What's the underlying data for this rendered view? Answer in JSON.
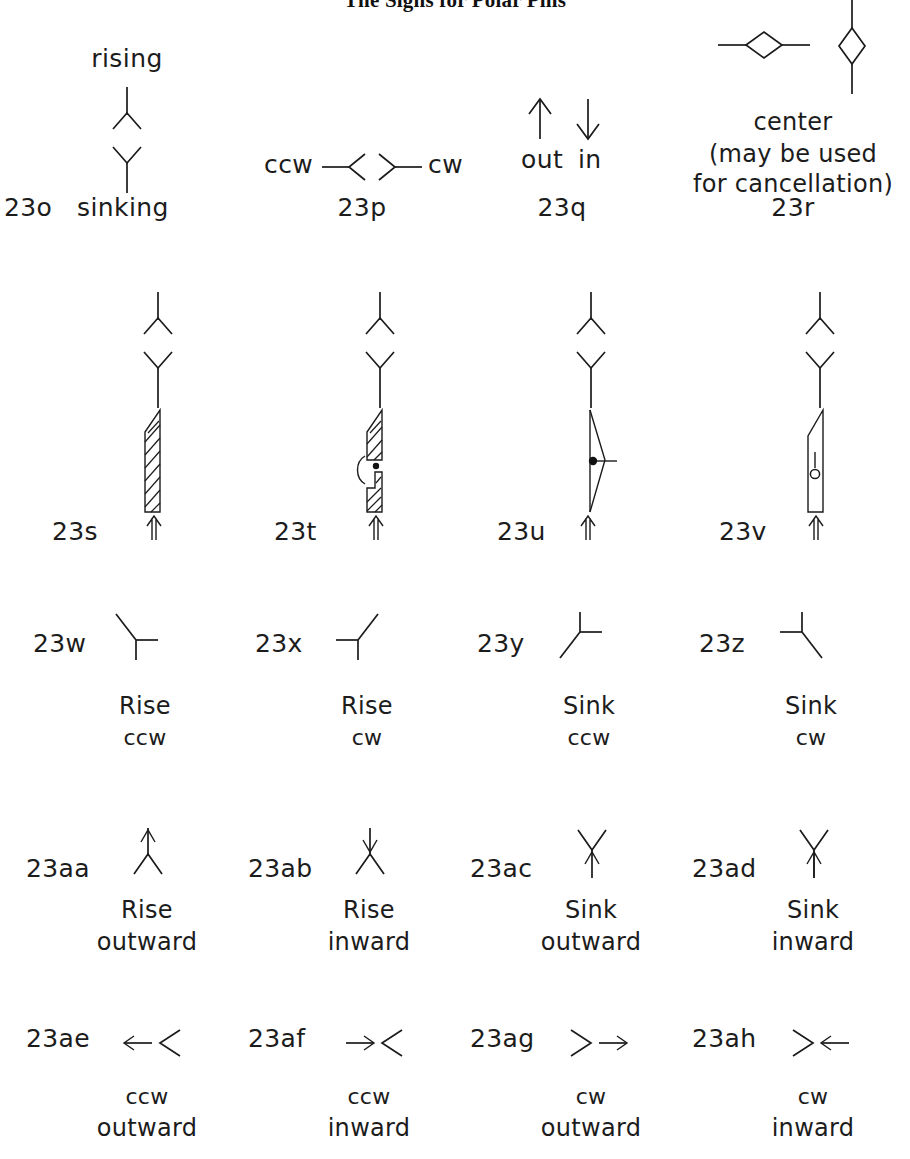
{
  "title": "The Signs for Polar Pins",
  "figure": {
    "type": "notation-reference-chart",
    "rows": [
      {
        "row_index": 1,
        "entries": [
          {
            "id": "23o",
            "code": "23o",
            "labels_above": [
              "rising"
            ],
            "labels_inline": [
              "sinking"
            ],
            "caption": "",
            "glyph": "vertical-line-with-up-chevron-and-down-chevron",
            "meaning": "rising (up chevron) / sinking (down chevron) on a vertical pin"
          },
          {
            "id": "23p",
            "code": "23p",
            "labels_left": [
              "ccw"
            ],
            "labels_right": [
              "cw"
            ],
            "caption": "",
            "glyph": "horizontal-line-with-left-chevron-and-right-chevron",
            "meaning": "counter-clockwise / clockwise on a horizontal pin"
          },
          {
            "id": "23q",
            "code": "23q",
            "labels_under_glyph": [
              "out",
              "in"
            ],
            "caption": "",
            "glyph": "up-arrow-out-and-down-arrow-in",
            "meaning": "out (arrow away) / in (arrow toward)"
          },
          {
            "id": "23r",
            "code": "23r",
            "caption_lines": [
              "center",
              "(may  be  used",
              "for  cancellation)"
            ],
            "glyph": "horizontal-diamond-and-vertical-diamond",
            "meaning": "center; may be used for cancellation"
          }
        ]
      },
      {
        "row_index": 2,
        "entries": [
          {
            "id": "23s",
            "code": "23s",
            "glyph": "pin-with-single-hatched-blade",
            "caption_lines": []
          },
          {
            "id": "23t",
            "code": "23t",
            "glyph": "pin-with-split-hatched-blade-and-dot-and-arc",
            "caption_lines": []
          },
          {
            "id": "23u",
            "code": "23u",
            "glyph": "pin-with-open-lens-blade-filled-dot-and-tick",
            "caption_lines": []
          },
          {
            "id": "23v",
            "code": "23v",
            "glyph": "pin-with-open-blade-hollow-circle-and-tick",
            "caption_lines": []
          }
        ]
      },
      {
        "row_index": 3,
        "entries": [
          {
            "id": "23w",
            "code": "23w",
            "glyph": "three-prong-rise-ccw",
            "caption_lines": [
              "Rise",
              "ccw"
            ]
          },
          {
            "id": "23x",
            "code": "23x",
            "glyph": "three-prong-rise-cw",
            "caption_lines": [
              "Rise",
              "cw"
            ]
          },
          {
            "id": "23y",
            "code": "23y",
            "glyph": "three-prong-sink-ccw",
            "caption_lines": [
              "Sink",
              "ccw"
            ]
          },
          {
            "id": "23z",
            "code": "23z",
            "glyph": "three-prong-sink-cw",
            "caption_lines": [
              "Sink",
              "cw"
            ]
          }
        ]
      },
      {
        "row_index": 4,
        "entries": [
          {
            "id": "23aa",
            "code": "23aa",
            "glyph": "rise-chevron-with-out-arrowhead",
            "caption_lines": [
              "Rise",
              "outward"
            ]
          },
          {
            "id": "23ab",
            "code": "23ab",
            "glyph": "rise-chevron-with-in-arrowhead",
            "caption_lines": [
              "Rise",
              "inward"
            ]
          },
          {
            "id": "23ac",
            "code": "23ac",
            "glyph": "sink-chevron-with-out-arrowhead",
            "caption_lines": [
              "Sink",
              "outward"
            ]
          },
          {
            "id": "23ad",
            "code": "23ad",
            "glyph": "sink-chevron-with-in-arrowhead",
            "caption_lines": [
              "Sink",
              "inward"
            ]
          }
        ]
      },
      {
        "row_index": 5,
        "entries": [
          {
            "id": "23ae",
            "code": "23ae",
            "glyph": "left-arrow-with-left-chevron",
            "caption_lines": [
              "ccw",
              "outward"
            ]
          },
          {
            "id": "23af",
            "code": "23af",
            "glyph": "right-arrow-with-left-chevron",
            "caption_lines": [
              "ccw",
              "inward"
            ]
          },
          {
            "id": "23ag",
            "code": "23ag",
            "glyph": "right-chevron-with-right-arrow",
            "caption_lines": [
              "cw",
              "outward"
            ]
          },
          {
            "id": "23ah",
            "code": "23ah",
            "glyph": "right-chevron-with-left-arrow",
            "caption_lines": [
              "cw",
              "inward"
            ]
          }
        ]
      }
    ]
  },
  "colors": {
    "ink": "#1b1b1b",
    "background": "#ffffff"
  }
}
